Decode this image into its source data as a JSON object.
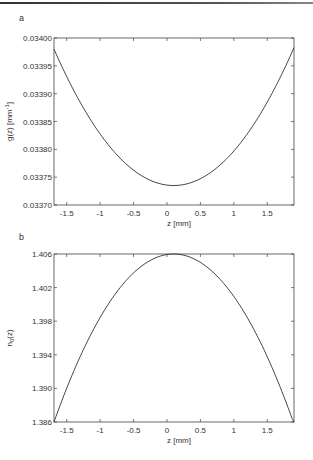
{
  "chart_data": [
    {
      "type": "line",
      "panel": "a",
      "title": "",
      "xlabel": "z [mm]",
      "ylabel": "g(z) [mm⁻¹]",
      "xlim": [
        -1.69,
        1.9
      ],
      "ylim": [
        0.0337,
        0.034
      ],
      "xticks": [
        -1.5,
        -1,
        -0.5,
        0,
        0.5,
        1,
        1.5
      ],
      "xtick_labels": [
        "-1.5",
        "-1",
        "-0.5",
        "0",
        "0.5",
        "1",
        "1.5"
      ],
      "yticks": [
        0.0337,
        0.03375,
        0.0338,
        0.03385,
        0.0339,
        0.03395,
        0.034
      ],
      "ytick_labels": [
        "0.03370",
        "0.03375",
        "0.03380",
        "0.03385",
        "0.03390",
        "0.03395",
        "0.03400"
      ],
      "grid": false,
      "series": [
        {
          "name": "g(z)",
          "x": [
            -1.69,
            -1.5,
            -1.25,
            -1.0,
            -0.75,
            -0.5,
            -0.25,
            0.0,
            0.1,
            0.25,
            0.5,
            0.75,
            1.0,
            1.25,
            1.5,
            1.75,
            1.9
          ],
          "y": [
            0.03398,
            0.033932,
            0.033877,
            0.03383,
            0.033791,
            0.033762,
            0.033744,
            0.033736,
            0.033735,
            0.033737,
            0.033751,
            0.033776,
            0.033811,
            0.033857,
            0.033914,
            0.033982,
            0.03398
          ]
        }
      ]
    },
    {
      "type": "line",
      "panel": "b",
      "title": "",
      "xlabel": "z [mm]",
      "ylabel": "n₀(z)",
      "xlim": [
        -1.69,
        1.9
      ],
      "ylim": [
        1.386,
        1.406
      ],
      "xticks": [
        -1.5,
        -1,
        -0.5,
        0,
        0.5,
        1,
        1.5
      ],
      "xtick_labels": [
        "-1.5",
        "-1",
        "-0.5",
        "0",
        "0.5",
        "1",
        "1.5"
      ],
      "yticks": [
        1.386,
        1.39,
        1.394,
        1.398,
        1.402,
        1.406
      ],
      "ytick_labels": [
        "1.386",
        "1.390",
        "1.394",
        "1.398",
        "1.402",
        "1.406"
      ],
      "grid": false,
      "series": [
        {
          "name": "n0(z)",
          "x": [
            -1.69,
            -1.5,
            -1.25,
            -1.0,
            -0.75,
            -0.5,
            -0.25,
            0.0,
            0.1,
            0.25,
            0.5,
            0.75,
            1.0,
            1.25,
            1.5,
            1.75,
            1.9
          ],
          "y": [
            1.386,
            1.39,
            1.3946,
            1.3984,
            1.4015,
            1.4037,
            1.4052,
            1.4059,
            1.406,
            1.4059,
            1.405,
            1.4033,
            1.4008,
            1.3975,
            1.3934,
            1.3886,
            1.386
          ]
        }
      ]
    }
  ],
  "panels": {
    "a": {
      "label": "a",
      "ylabel_main": "g(z) [mm",
      "ylabel_sup": "-1",
      "ylabel_end": "]",
      "xlabel": "z [mm]"
    },
    "b": {
      "label": "b",
      "ylabel_main": "n",
      "ylabel_sub": "0",
      "ylabel_end": "(z)",
      "xlabel": "z [mm]"
    }
  }
}
